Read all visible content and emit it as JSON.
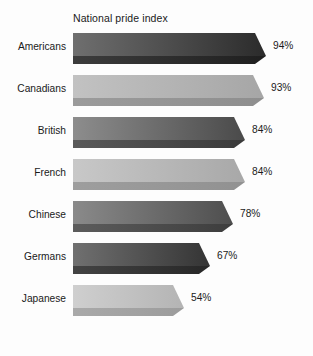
{
  "chart": {
    "title": "National pride index",
    "background_color": "#fdfdfd",
    "text_color": "#1a1a1a"
  },
  "chart_data": {
    "type": "bar",
    "orientation": "horizontal",
    "title": "National pride index",
    "xlabel": "",
    "ylabel": "",
    "xlim": [
      0,
      100
    ],
    "grid": false,
    "legend": false,
    "value_suffix": "%",
    "categories": [
      "Americans",
      "Canadians",
      "British",
      "French",
      "Chinese",
      "Germans",
      "Japanese"
    ],
    "values": [
      94,
      93,
      84,
      84,
      78,
      67,
      54
    ],
    "value_labels": [
      "94%",
      "93%",
      "84%",
      "84%",
      "78%",
      "67%",
      "54%"
    ],
    "bars": [
      {
        "category": "Americans",
        "value": 94,
        "value_label": "94%",
        "face_start_color": "#6f6f6f",
        "face_end_color": "#2b2b2b",
        "bottom_color": "#3c3c3c",
        "bevel_color": "#1f1f1f"
      },
      {
        "category": "Canadians",
        "value": 93,
        "value_label": "93%",
        "face_start_color": "#c2c2c2",
        "face_end_color": "#a6a6a6",
        "bottom_color": "#9b9b9b",
        "bevel_color": "#8e8e8e"
      },
      {
        "category": "British",
        "value": 84,
        "value_label": "84%",
        "face_start_color": "#8d8d8d",
        "face_end_color": "#4a4a4a",
        "bottom_color": "#5a5a5a",
        "bevel_color": "#3a3a3a"
      },
      {
        "category": "French",
        "value": 84,
        "value_label": "84%",
        "face_start_color": "#c8c8c8",
        "face_end_color": "#a8a8a8",
        "bottom_color": "#9e9e9e",
        "bevel_color": "#919191"
      },
      {
        "category": "Chinese",
        "value": 78,
        "value_label": "78%",
        "face_start_color": "#8a8a8a",
        "face_end_color": "#4e4e4e",
        "bottom_color": "#5c5c5c",
        "bevel_color": "#3d3d3d"
      },
      {
        "category": "Germans",
        "value": 67,
        "value_label": "67%",
        "face_start_color": "#707070",
        "face_end_color": "#343434",
        "bottom_color": "#434343",
        "bevel_color": "#272727"
      },
      {
        "category": "Japanese",
        "value": 54,
        "value_label": "54%",
        "face_start_color": "#cfcfcf",
        "face_end_color": "#b4b4b4",
        "bottom_color": "#a9a9a9",
        "bevel_color": "#9c9c9c"
      }
    ]
  }
}
